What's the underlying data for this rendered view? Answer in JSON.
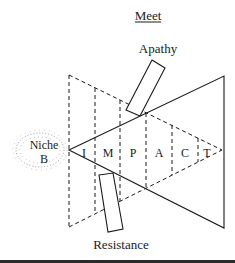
{
  "diagram": {
    "title": "Meet",
    "top_force_label": "Apathy",
    "bottom_force_label": "Resistance",
    "niche_label_line1": "Niche",
    "niche_label_line2": "B",
    "impact_letters": [
      "I",
      "M",
      "P",
      "A",
      "C",
      "T"
    ]
  },
  "colors": {
    "line": "#1a1a1a",
    "background": "#ffffff",
    "niche_stipple": "#8a8a8a"
  }
}
